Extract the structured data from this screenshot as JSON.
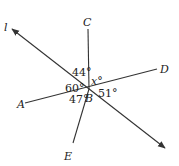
{
  "diagram": {
    "type": "geometry-lines-through-point",
    "points": {
      "A": "A",
      "B": "B",
      "C": "C",
      "D": "D",
      "E": "E"
    },
    "line_label": "l",
    "angles": {
      "l_C": "44°",
      "l_A": "60°",
      "A_E": "47°",
      "D_ray": "51°",
      "C_D": "x°"
    },
    "colors": {
      "stroke": "#333333",
      "text": "#222222",
      "background": "#ffffff"
    }
  }
}
